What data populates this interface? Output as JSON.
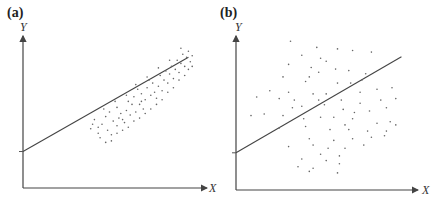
{
  "chart_data": [
    {
      "type": "scatter",
      "panel_label": "(a)",
      "title": "",
      "xlabel": "X",
      "ylabel": "Y",
      "grid": false,
      "ticks": "none",
      "description": "Tightly clustered points around a positively sloped regression line (strong correlation)",
      "regression_line": {
        "x0": 0,
        "y0": 0.24,
        "x1": 0.88,
        "y1": 0.86
      },
      "points": [
        [
          0.36,
          0.39
        ],
        [
          0.4,
          0.36
        ],
        [
          0.38,
          0.45
        ],
        [
          0.42,
          0.42
        ],
        [
          0.45,
          0.38
        ],
        [
          0.44,
          0.47
        ],
        [
          0.48,
          0.44
        ],
        [
          0.47,
          0.35
        ],
        [
          0.5,
          0.41
        ],
        [
          0.52,
          0.49
        ],
        [
          0.41,
          0.33
        ],
        [
          0.46,
          0.5
        ],
        [
          0.5,
          0.53
        ],
        [
          0.53,
          0.45
        ],
        [
          0.55,
          0.51
        ],
        [
          0.54,
          0.43
        ],
        [
          0.57,
          0.48
        ],
        [
          0.58,
          0.55
        ],
        [
          0.6,
          0.5
        ],
        [
          0.56,
          0.57
        ],
        [
          0.59,
          0.6
        ],
        [
          0.62,
          0.55
        ],
        [
          0.63,
          0.62
        ],
        [
          0.61,
          0.65
        ],
        [
          0.65,
          0.58
        ],
        [
          0.66,
          0.66
        ],
        [
          0.64,
          0.52
        ],
        [
          0.68,
          0.61
        ],
        [
          0.69,
          0.69
        ],
        [
          0.7,
          0.63
        ],
        [
          0.67,
          0.71
        ],
        [
          0.72,
          0.67
        ],
        [
          0.73,
          0.74
        ],
        [
          0.71,
          0.59
        ],
        [
          0.74,
          0.64
        ],
        [
          0.75,
          0.71
        ],
        [
          0.76,
          0.77
        ],
        [
          0.77,
          0.69
        ],
        [
          0.78,
          0.75
        ],
        [
          0.79,
          0.8
        ],
        [
          0.8,
          0.72
        ],
        [
          0.81,
          0.78
        ],
        [
          0.82,
          0.84
        ],
        [
          0.83,
          0.76
        ],
        [
          0.84,
          0.82
        ],
        [
          0.85,
          0.88
        ],
        [
          0.86,
          0.8
        ],
        [
          0.87,
          0.86
        ],
        [
          0.88,
          0.9
        ],
        [
          0.89,
          0.83
        ],
        [
          0.9,
          0.87
        ],
        [
          0.88,
          0.78
        ],
        [
          0.86,
          0.74
        ],
        [
          0.83,
          0.71
        ],
        [
          0.8,
          0.66
        ],
        [
          0.77,
          0.63
        ],
        [
          0.74,
          0.58
        ],
        [
          0.71,
          0.55
        ],
        [
          0.68,
          0.52
        ],
        [
          0.65,
          0.49
        ],
        [
          0.62,
          0.46
        ],
        [
          0.59,
          0.44
        ],
        [
          0.56,
          0.4
        ],
        [
          0.53,
          0.38
        ],
        [
          0.5,
          0.36
        ],
        [
          0.47,
          0.31
        ],
        [
          0.44,
          0.3
        ],
        [
          0.4,
          0.4
        ],
        [
          0.43,
          0.52
        ],
        [
          0.49,
          0.57
        ],
        [
          0.55,
          0.61
        ],
        [
          0.6,
          0.68
        ],
        [
          0.66,
          0.73
        ],
        [
          0.72,
          0.79
        ],
        [
          0.78,
          0.84
        ],
        [
          0.84,
          0.92
        ],
        [
          0.9,
          0.8
        ],
        [
          0.37,
          0.42
        ],
        [
          0.51,
          0.46
        ],
        [
          0.63,
          0.57
        ]
      ]
    },
    {
      "type": "scatter",
      "panel_label": "(b)",
      "title": "",
      "xlabel": "X",
      "ylabel": "Y",
      "grid": false,
      "ticks": "none",
      "description": "Widely scattered points around a positively sloped regression line (weak correlation)",
      "regression_line": {
        "x0": 0,
        "y0": 0.24,
        "x1": 0.88,
        "y1": 0.86
      },
      "points": [
        [
          0.29,
          0.96
        ],
        [
          0.43,
          0.92
        ],
        [
          0.54,
          0.91
        ],
        [
          0.62,
          0.9
        ],
        [
          0.72,
          0.89
        ],
        [
          0.35,
          0.87
        ],
        [
          0.45,
          0.85
        ],
        [
          0.28,
          0.81
        ],
        [
          0.4,
          0.79
        ],
        [
          0.53,
          0.78
        ],
        [
          0.6,
          0.77
        ],
        [
          0.44,
          0.76
        ],
        [
          0.69,
          0.75
        ],
        [
          0.25,
          0.73
        ],
        [
          0.39,
          0.73
        ],
        [
          0.37,
          0.7
        ],
        [
          0.54,
          0.69
        ],
        [
          0.61,
          0.69
        ],
        [
          0.18,
          0.64
        ],
        [
          0.28,
          0.63
        ],
        [
          0.41,
          0.62
        ],
        [
          0.48,
          0.62
        ],
        [
          0.66,
          0.63
        ],
        [
          0.75,
          0.65
        ],
        [
          0.83,
          0.66
        ],
        [
          0.11,
          0.6
        ],
        [
          0.23,
          0.59
        ],
        [
          0.31,
          0.58
        ],
        [
          0.44,
          0.58
        ],
        [
          0.56,
          0.58
        ],
        [
          0.66,
          0.56
        ],
        [
          0.77,
          0.58
        ],
        [
          0.85,
          0.59
        ],
        [
          0.35,
          0.54
        ],
        [
          0.47,
          0.55
        ],
        [
          0.57,
          0.52
        ],
        [
          0.63,
          0.5
        ],
        [
          0.71,
          0.51
        ],
        [
          0.8,
          0.53
        ],
        [
          0.08,
          0.48
        ],
        [
          0.15,
          0.49
        ],
        [
          0.25,
          0.48
        ],
        [
          0.36,
          0.46
        ],
        [
          0.52,
          0.47
        ],
        [
          0.62,
          0.46
        ],
        [
          0.75,
          0.43
        ],
        [
          0.82,
          0.44
        ],
        [
          0.23,
          0.4
        ],
        [
          0.37,
          0.41
        ],
        [
          0.5,
          0.39
        ],
        [
          0.6,
          0.39
        ],
        [
          0.7,
          0.38
        ],
        [
          0.8,
          0.38
        ],
        [
          0.85,
          0.42
        ],
        [
          0.39,
          0.33
        ],
        [
          0.52,
          0.32
        ],
        [
          0.62,
          0.33
        ],
        [
          0.72,
          0.34
        ],
        [
          0.79,
          0.35
        ],
        [
          0.28,
          0.28
        ],
        [
          0.41,
          0.29
        ],
        [
          0.49,
          0.27
        ],
        [
          0.58,
          0.27
        ],
        [
          0.68,
          0.29
        ],
        [
          0.45,
          0.23
        ],
        [
          0.55,
          0.22
        ],
        [
          0.35,
          0.2
        ],
        [
          0.48,
          0.19
        ],
        [
          0.55,
          0.17
        ],
        [
          0.33,
          0.15
        ],
        [
          0.41,
          0.14
        ],
        [
          0.39,
          0.12
        ],
        [
          0.54,
          0.11
        ],
        [
          0.3,
          0.53
        ],
        [
          0.45,
          0.47
        ],
        [
          0.58,
          0.42
        ],
        [
          0.67,
          0.71
        ],
        [
          0.48,
          0.83
        ]
      ]
    }
  ]
}
